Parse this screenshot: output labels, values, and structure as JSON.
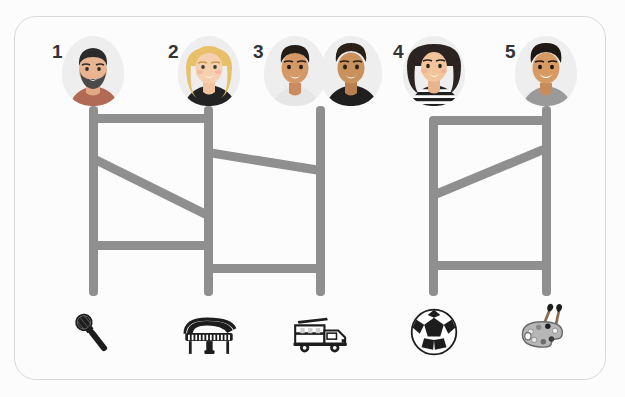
{
  "puzzle": {
    "title": "amidakuji-ladder-lottery",
    "frame": {
      "border_color": "#d9d9d9",
      "background": "#fcfcfc"
    },
    "line_color": "#8f8f8f",
    "columns": 5,
    "participants": [
      {
        "number": "1",
        "label": "bearded-man-avatar",
        "x": 93
      },
      {
        "number": "2",
        "label": "blonde-woman-avatar",
        "x": 208
      },
      {
        "number": "3",
        "label": "young-man-avatar",
        "x": 320
      },
      {
        "number": "3b",
        "label": "dark-shirt-man-avatar",
        "x": 368
      },
      {
        "number": "4",
        "label": "long-hair-woman-avatar",
        "x": 433
      },
      {
        "number": "5",
        "label": "smiling-man-avatar",
        "x": 546
      }
    ],
    "prizes": [
      {
        "name": "microphone",
        "label": "Microphone",
        "x": 93
      },
      {
        "name": "grand-piano",
        "label": "Grand piano",
        "x": 208
      },
      {
        "name": "fire-truck",
        "label": "Fire truck",
        "x": 320
      },
      {
        "name": "soccer-ball",
        "label": "Soccer ball",
        "x": 433
      },
      {
        "name": "artist-palette",
        "label": "Artist palette",
        "x": 546
      }
    ],
    "verticals": [
      {
        "x": 93,
        "top": 106,
        "bottom": 296
      },
      {
        "x": 208,
        "top": 106,
        "bottom": 296
      },
      {
        "x": 320,
        "top": 106,
        "bottom": 296
      },
      {
        "x": 433,
        "top": 116,
        "bottom": 296
      },
      {
        "x": 546,
        "top": 106,
        "bottom": 296
      }
    ],
    "rungs": [
      {
        "from": 93,
        "to": 208,
        "y1": 118,
        "y2": 118,
        "name": "rung-1-2-top"
      },
      {
        "from": 93,
        "to": 208,
        "y1": 158,
        "y2": 215,
        "name": "rung-1-2-diagonal"
      },
      {
        "from": 93,
        "to": 208,
        "y1": 245,
        "y2": 245,
        "name": "rung-1-2-lower"
      },
      {
        "from": 208,
        "to": 320,
        "y1": 152,
        "y2": 170,
        "name": "rung-2-3-diagonal"
      },
      {
        "from": 208,
        "to": 320,
        "y1": 268,
        "y2": 268,
        "name": "rung-2-3-lower"
      },
      {
        "from": 433,
        "to": 546,
        "y1": 120,
        "y2": 120,
        "name": "rung-4-5-top"
      },
      {
        "from": 433,
        "to": 546,
        "y1": 195,
        "y2": 148,
        "name": "rung-4-5-diagonal"
      },
      {
        "from": 433,
        "to": 546,
        "y1": 265,
        "y2": 265,
        "name": "rung-4-5-lower"
      }
    ]
  }
}
